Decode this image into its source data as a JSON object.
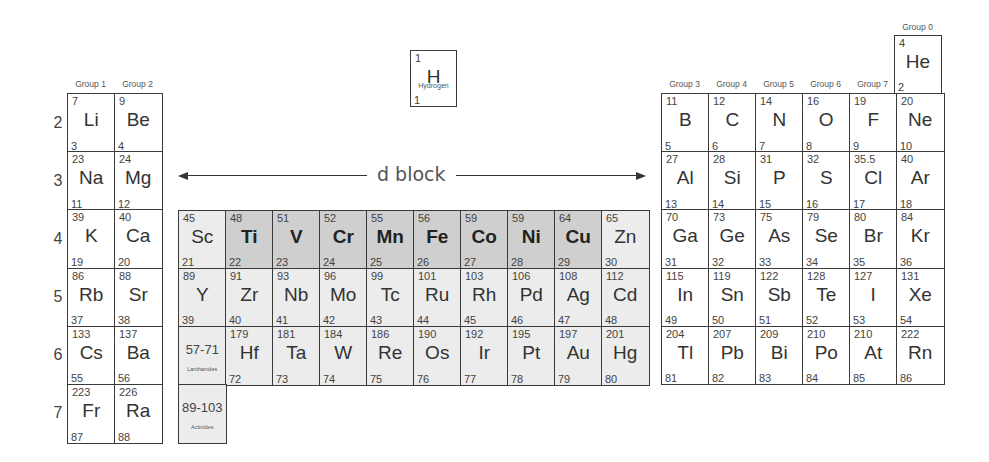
{
  "dblock_label": "d block",
  "group_labels": [
    "Group 1",
    "Group 2",
    "Group 3",
    "Group 4",
    "Group 5",
    "Group 6",
    "Group 7",
    "Group 0"
  ],
  "period_labels": [
    "2",
    "3",
    "4",
    "5",
    "6",
    "7"
  ],
  "hydrogen": {
    "mass": "1",
    "symbol": "H",
    "name": "Hydrogen",
    "number": "1"
  },
  "helium": {
    "mass": "4",
    "symbol": "He",
    "number": "2"
  },
  "s_block": [
    [
      {
        "mass": "7",
        "symbol": "Li",
        "number": "3"
      },
      {
        "mass": "9",
        "symbol": "Be",
        "number": "4"
      }
    ],
    [
      {
        "mass": "23",
        "symbol": "Na",
        "number": "11"
      },
      {
        "mass": "24",
        "symbol": "Mg",
        "number": "12"
      }
    ],
    [
      {
        "mass": "39",
        "symbol": "K",
        "number": "19"
      },
      {
        "mass": "40",
        "symbol": "Ca",
        "number": "20"
      }
    ],
    [
      {
        "mass": "86",
        "symbol": "Rb",
        "number": "37"
      },
      {
        "mass": "88",
        "symbol": "Sr",
        "number": "38"
      }
    ],
    [
      {
        "mass": "133",
        "symbol": "Cs",
        "number": "55"
      },
      {
        "mass": "137",
        "symbol": "Ba",
        "number": "56"
      }
    ],
    [
      {
        "mass": "223",
        "symbol": "Fr",
        "number": "87"
      },
      {
        "mass": "226",
        "symbol": "Ra",
        "number": "88"
      }
    ]
  ],
  "d_block": [
    [
      {
        "mass": "45",
        "symbol": "Sc",
        "number": "21"
      },
      {
        "mass": "48",
        "symbol": "Ti",
        "number": "22",
        "highlight": true
      },
      {
        "mass": "51",
        "symbol": "V",
        "number": "23",
        "highlight": true
      },
      {
        "mass": "52",
        "symbol": "Cr",
        "number": "24",
        "highlight": true
      },
      {
        "mass": "55",
        "symbol": "Mn",
        "number": "25",
        "highlight": true
      },
      {
        "mass": "56",
        "symbol": "Fe",
        "number": "26",
        "highlight": true
      },
      {
        "mass": "59",
        "symbol": "Co",
        "number": "27",
        "highlight": true
      },
      {
        "mass": "59",
        "symbol": "Ni",
        "number": "28",
        "highlight": true
      },
      {
        "mass": "64",
        "symbol": "Cu",
        "number": "29",
        "highlight": true
      },
      {
        "mass": "65",
        "symbol": "Zn",
        "number": "30"
      }
    ],
    [
      {
        "mass": "89",
        "symbol": "Y",
        "number": "39"
      },
      {
        "mass": "91",
        "symbol": "Zr",
        "number": "40"
      },
      {
        "mass": "93",
        "symbol": "Nb",
        "number": "41"
      },
      {
        "mass": "96",
        "symbol": "Mo",
        "number": "42"
      },
      {
        "mass": "99",
        "symbol": "Tc",
        "number": "43"
      },
      {
        "mass": "101",
        "symbol": "Ru",
        "number": "44"
      },
      {
        "mass": "103",
        "symbol": "Rh",
        "number": "45"
      },
      {
        "mass": "106",
        "symbol": "Pd",
        "number": "46"
      },
      {
        "mass": "108",
        "symbol": "Ag",
        "number": "47"
      },
      {
        "mass": "112",
        "symbol": "Cd",
        "number": "48"
      }
    ],
    [
      {
        "range": "57-71",
        "range_name": "Lanthanides"
      },
      {
        "mass": "179",
        "symbol": "Hf",
        "number": "72"
      },
      {
        "mass": "181",
        "symbol": "Ta",
        "number": "73"
      },
      {
        "mass": "184",
        "symbol": "W",
        "number": "74"
      },
      {
        "mass": "186",
        "symbol": "Re",
        "number": "75"
      },
      {
        "mass": "190",
        "symbol": "Os",
        "number": "76"
      },
      {
        "mass": "192",
        "symbol": "Ir",
        "number": "77"
      },
      {
        "mass": "195",
        "symbol": "Pt",
        "number": "78"
      },
      {
        "mass": "197",
        "symbol": "Au",
        "number": "79"
      },
      {
        "mass": "201",
        "symbol": "Hg",
        "number": "80"
      }
    ],
    [
      {
        "range": "89-103",
        "range_name": "Actinides"
      }
    ]
  ],
  "p_block": [
    [
      {
        "mass": "11",
        "symbol": "B",
        "number": "5"
      },
      {
        "mass": "12",
        "symbol": "C",
        "number": "6"
      },
      {
        "mass": "14",
        "symbol": "N",
        "number": "7"
      },
      {
        "mass": "16",
        "symbol": "O",
        "number": "8"
      },
      {
        "mass": "19",
        "symbol": "F",
        "number": "9"
      },
      {
        "mass": "20",
        "symbol": "Ne",
        "number": "10"
      }
    ],
    [
      {
        "mass": "27",
        "symbol": "Al",
        "number": "13"
      },
      {
        "mass": "28",
        "symbol": "Si",
        "number": "14"
      },
      {
        "mass": "31",
        "symbol": "P",
        "number": "15"
      },
      {
        "mass": "32",
        "symbol": "S",
        "number": "16"
      },
      {
        "mass": "35.5",
        "symbol": "Cl",
        "number": "17"
      },
      {
        "mass": "40",
        "symbol": "Ar",
        "number": "18"
      }
    ],
    [
      {
        "mass": "70",
        "symbol": "Ga",
        "number": "31"
      },
      {
        "mass": "73",
        "symbol": "Ge",
        "number": "32"
      },
      {
        "mass": "75",
        "symbol": "As",
        "number": "33"
      },
      {
        "mass": "79",
        "symbol": "Se",
        "number": "34"
      },
      {
        "mass": "80",
        "symbol": "Br",
        "number": "35"
      },
      {
        "mass": "84",
        "symbol": "Kr",
        "number": "36"
      }
    ],
    [
      {
        "mass": "115",
        "symbol": "In",
        "number": "49"
      },
      {
        "mass": "119",
        "symbol": "Sn",
        "number": "50"
      },
      {
        "mass": "122",
        "symbol": "Sb",
        "number": "51"
      },
      {
        "mass": "128",
        "symbol": "Te",
        "number": "52"
      },
      {
        "mass": "127",
        "symbol": "I",
        "number": "53"
      },
      {
        "mass": "131",
        "symbol": "Xe",
        "number": "54"
      }
    ],
    [
      {
        "mass": "204",
        "symbol": "Tl",
        "number": "81"
      },
      {
        "mass": "207",
        "symbol": "Pb",
        "number": "82"
      },
      {
        "mass": "209",
        "symbol": "Bi",
        "number": "83"
      },
      {
        "mass": "210",
        "symbol": "Po",
        "number": "84"
      },
      {
        "mass": "210",
        "symbol": "At",
        "number": "85"
      },
      {
        "mass": "222",
        "symbol": "Rn",
        "number": "86"
      }
    ]
  ],
  "colors": {
    "border": "#3a3a3a",
    "transition_bg": "#ececec",
    "highlight_bg": "#cfcfcf"
  }
}
